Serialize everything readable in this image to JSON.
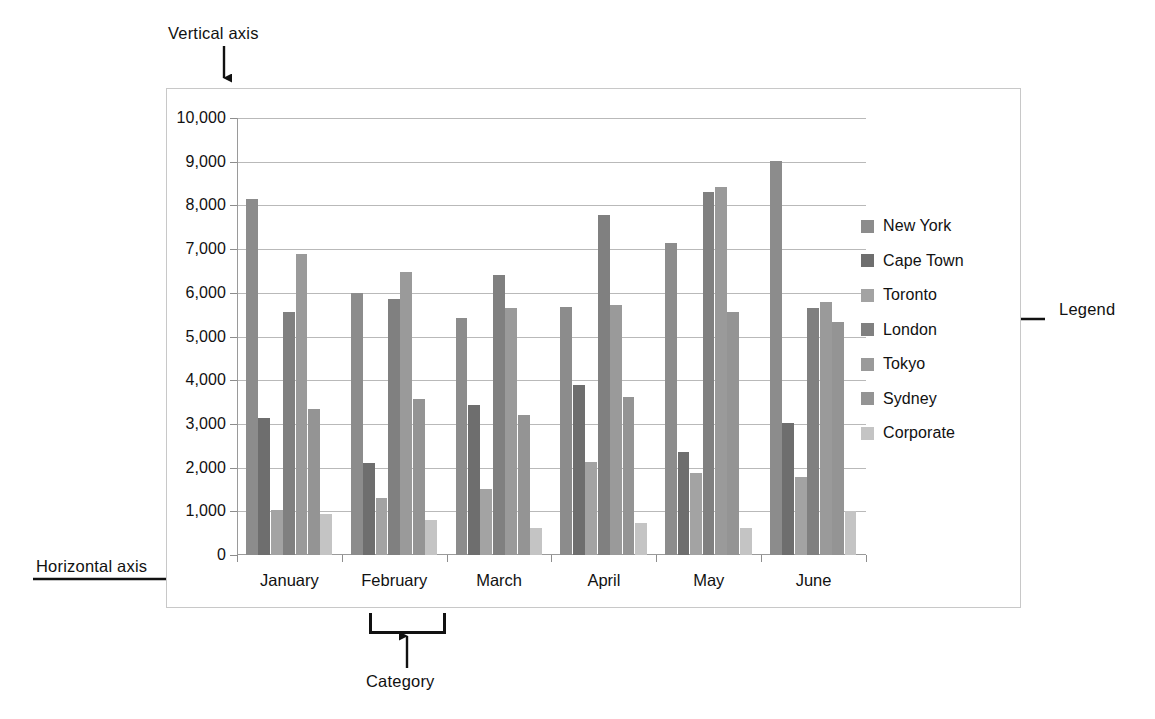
{
  "annotations": {
    "vertical_axis": "Vertical axis",
    "horizontal_axis": "Horizontal axis",
    "legend": "Legend",
    "category": "Category"
  },
  "chart_data": {
    "type": "bar",
    "title": "",
    "xlabel": "",
    "ylabel": "",
    "ylim": [
      0,
      10000
    ],
    "grid": true,
    "legend_position": "right",
    "categories": [
      "January",
      "February",
      "March",
      "April",
      "May",
      "June"
    ],
    "ytick_labels": [
      "10,000",
      "9,000",
      "8,000",
      "7,000",
      "6,000",
      "5,000",
      "4,000",
      "3,000",
      "2,000",
      "1,000",
      "0"
    ],
    "ytick_values": [
      10000,
      9000,
      8000,
      7000,
      6000,
      5000,
      4000,
      3000,
      2000,
      1000,
      0
    ],
    "series": [
      {
        "name": "New York",
        "color": "#8c8c8c",
        "values": [
          8150,
          6000,
          5430,
          5670,
          7140,
          9010
        ]
      },
      {
        "name": "Cape Town",
        "color": "#6e6e6e",
        "values": [
          3140,
          2100,
          3440,
          3900,
          2360,
          3020
        ]
      },
      {
        "name": "Toronto",
        "color": "#a3a3a3",
        "values": [
          1020,
          1300,
          1510,
          2120,
          1870,
          1780
        ]
      },
      {
        "name": "London",
        "color": "#808080",
        "values": [
          5550,
          5850,
          6400,
          7780,
          8300,
          5660
        ]
      },
      {
        "name": "Tokyo",
        "color": "#9a9a9a",
        "values": [
          6880,
          6470,
          5660,
          5720,
          8430,
          5800
        ]
      },
      {
        "name": "Sydney",
        "color": "#949494",
        "values": [
          3340,
          3560,
          3200,
          3620,
          5570,
          5340
        ]
      },
      {
        "name": "Corporate",
        "color": "#c4c4c4",
        "values": [
          950,
          810,
          620,
          730,
          620,
          1010
        ]
      }
    ]
  }
}
